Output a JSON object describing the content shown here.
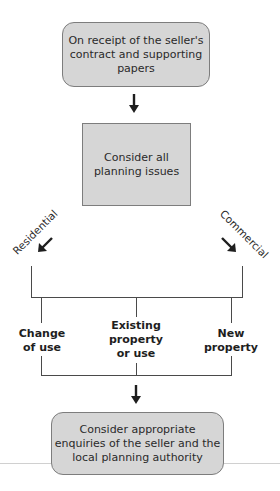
{
  "diagram": {
    "type": "flowchart",
    "start_box": {
      "lines": [
        "On receipt of the seller's",
        "contract and supporting",
        "papers"
      ]
    },
    "planning_box": {
      "lines": [
        "Consider all",
        "planning issues"
      ]
    },
    "branches": {
      "left": "Residential",
      "right": "Commercial"
    },
    "categories": [
      {
        "lines": [
          "Change",
          "of use"
        ]
      },
      {
        "lines": [
          "Existing",
          "property",
          "or use"
        ]
      },
      {
        "lines": [
          "New",
          "property"
        ]
      }
    ],
    "end_box": {
      "lines": [
        "Consider appropriate",
        "enquiries of the seller and the",
        "local planning authority"
      ]
    },
    "colors": {
      "box_fill": "#d6d6d6",
      "box_border": "#7d7d7d",
      "line": "#4a4a4a",
      "arrow": "#1e1e1e"
    }
  }
}
